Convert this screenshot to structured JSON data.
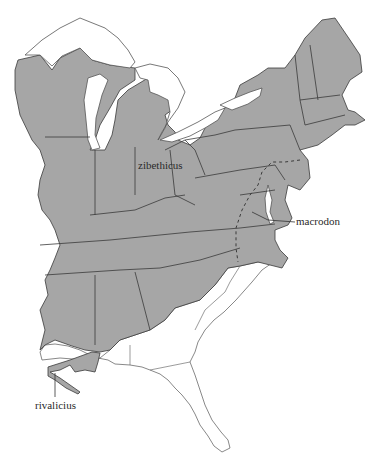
{
  "map": {
    "region": "Eastern United States",
    "fill_color": "#a6a6a6",
    "background": "#ffffff",
    "labels": {
      "zibethicus": "zibethicus",
      "macrodon": "macrodon",
      "rivalicius": "rivalicius"
    },
    "legend": {
      "shaded": "range",
      "dashed_line": "subspecies boundary"
    }
  }
}
